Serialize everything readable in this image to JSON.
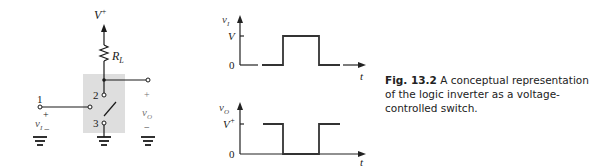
{
  "circuit": {
    "supply_label": "V",
    "supply_sup": "+",
    "resistor_label": "R",
    "resistor_sub": "L",
    "node_labels": [
      "1",
      "2",
      "3"
    ],
    "input_label": "v",
    "input_sub": "I",
    "output_label": "v",
    "output_sub": "O",
    "plus": "+",
    "minus": "−"
  },
  "waveforms": {
    "top": {
      "ylabel": "v",
      "ylabel_sub": "I",
      "level_label": "V",
      "zero_label": "0",
      "xlabel": "t"
    },
    "bottom": {
      "ylabel": "v",
      "ylabel_sub": "O",
      "level_label": "V",
      "level_sup": "+",
      "zero_label": "0",
      "xlabel": "t"
    }
  },
  "caption": {
    "fig_label": "Fig. 13.2",
    "text": " A conceptual representation of the logic inverter as a voltage-controlled switch."
  },
  "colors": {
    "ink": "#1a1a1a",
    "shade": "#dcdcdc"
  }
}
